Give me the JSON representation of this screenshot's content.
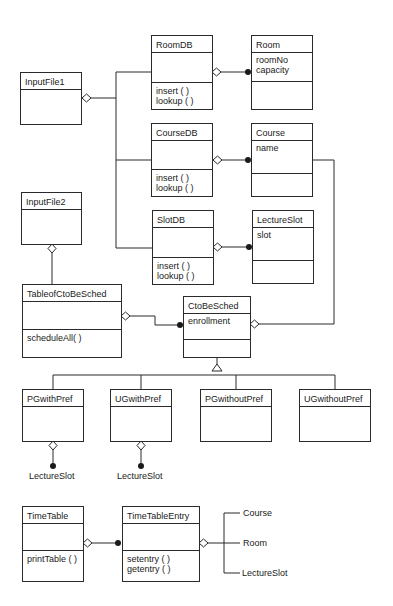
{
  "diagram": {
    "type": "UML class diagram",
    "classes": {
      "inputfile1": {
        "name": "InputFile1",
        "attributes": [],
        "operations": []
      },
      "roomdb": {
        "name": "RoomDB",
        "attributes": [],
        "operations": [
          "insert ( )",
          "lookup ( )"
        ]
      },
      "room": {
        "name": "Room",
        "attributes": [
          "roomNo",
          "capacity"
        ],
        "operations": []
      },
      "coursedb": {
        "name": "CourseDB",
        "attributes": [],
        "operations": [
          "insert ( )",
          "lookup ( )"
        ]
      },
      "course": {
        "name": "Course",
        "attributes": [
          "name"
        ],
        "operations": []
      },
      "inputfile2": {
        "name": "InputFile2",
        "attributes": [],
        "operations": []
      },
      "slotdb": {
        "name": "SlotDB",
        "attributes": [],
        "operations": [
          "insert ( )",
          "lookup ( )"
        ]
      },
      "lectureslot": {
        "name": "LectureSlot",
        "attributes": [
          "slot"
        ],
        "operations": []
      },
      "tableofctobesched": {
        "name": "TableofCtoBeSched",
        "attributes": [],
        "operations": [
          "scheduleAll( )"
        ]
      },
      "ctobesched": {
        "name": "CtoBeSched",
        "attributes": [
          "enrollment"
        ],
        "operations": []
      },
      "pgwithpref": {
        "name": "PGwithPref",
        "attributes": [],
        "operations": []
      },
      "ugwithpref": {
        "name": "UGwithPref",
        "attributes": [],
        "operations": []
      },
      "pgwithoutpref": {
        "name": "PGwithoutPref",
        "attributes": [],
        "operations": []
      },
      "ugwithoutpref": {
        "name": "UGwithoutPref",
        "attributes": [],
        "operations": []
      },
      "timetable": {
        "name": "TimeTable",
        "attributes": [],
        "operations": [
          "printTable ( )"
        ]
      },
      "timetableentry": {
        "name": "TimeTableEntry",
        "attributes": [],
        "operations": [
          "setentry ( )",
          "getentry ( )"
        ]
      }
    },
    "labels": {
      "pg_lectureslot": "LectureSlot",
      "ug_lectureslot": "LectureSlot",
      "tte_course": "Course",
      "tte_room": "Room",
      "tte_lectureslot": "LectureSlot"
    },
    "relationships": [
      {
        "from": "InputFile1",
        "to": "RoomDB",
        "kind": "aggregation"
      },
      {
        "from": "InputFile1",
        "to": "CourseDB",
        "kind": "aggregation"
      },
      {
        "from": "InputFile1",
        "to": "SlotDB",
        "kind": "aggregation"
      },
      {
        "from": "RoomDB",
        "to": "Room",
        "kind": "aggregation-many"
      },
      {
        "from": "CourseDB",
        "to": "Course",
        "kind": "aggregation-many"
      },
      {
        "from": "SlotDB",
        "to": "LectureSlot",
        "kind": "aggregation-many"
      },
      {
        "from": "InputFile2",
        "to": "TableofCtoBeSched",
        "kind": "aggregation"
      },
      {
        "from": "TableofCtoBeSched",
        "to": "CtoBeSched",
        "kind": "aggregation-many"
      },
      {
        "from": "CtoBeSched",
        "to": "Course",
        "kind": "aggregation"
      },
      {
        "from": "PGwithPref",
        "to": "CtoBeSched",
        "kind": "generalization"
      },
      {
        "from": "UGwithPref",
        "to": "CtoBeSched",
        "kind": "generalization"
      },
      {
        "from": "PGwithoutPref",
        "to": "CtoBeSched",
        "kind": "generalization"
      },
      {
        "from": "UGwithoutPref",
        "to": "CtoBeSched",
        "kind": "generalization"
      },
      {
        "from": "PGwithPref",
        "to": "LectureSlot",
        "kind": "aggregation-many"
      },
      {
        "from": "UGwithPref",
        "to": "LectureSlot",
        "kind": "aggregation-many"
      },
      {
        "from": "TimeTable",
        "to": "TimeTableEntry",
        "kind": "aggregation-many"
      },
      {
        "from": "TimeTableEntry",
        "to": "Course",
        "kind": "aggregation"
      },
      {
        "from": "TimeTableEntry",
        "to": "Room",
        "kind": "aggregation"
      },
      {
        "from": "TimeTableEntry",
        "to": "LectureSlot",
        "kind": "aggregation"
      }
    ]
  }
}
